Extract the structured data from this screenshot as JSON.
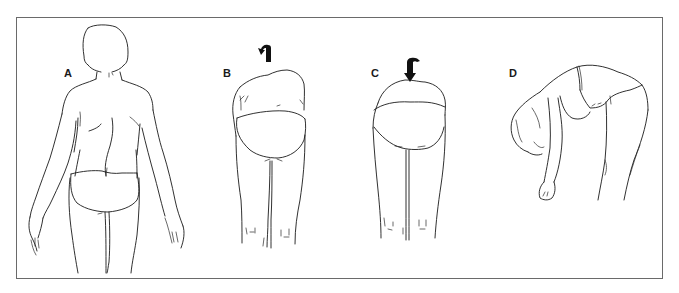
{
  "figure": {
    "panels": [
      {
        "id": "A",
        "label": "A",
        "view": "standing, posterior view",
        "annotation": "visible spinal curvature with shoulder asymmetry"
      },
      {
        "id": "B",
        "label": "B",
        "view": "forward bend, posterior view",
        "annotation": "rotational arrow indicating rib hump / trunk rotation"
      },
      {
        "id": "C",
        "label": "C",
        "view": "forward bend, posterior view",
        "annotation": "downward curved arrow indicating symmetric back"
      },
      {
        "id": "D",
        "label": "D",
        "view": "forward bend, lateral view",
        "annotation": "Adams forward bend test profile"
      }
    ]
  },
  "colors": {
    "line": "#1a1a1a",
    "frame": "#6a6a6a",
    "background": "#ffffff"
  }
}
